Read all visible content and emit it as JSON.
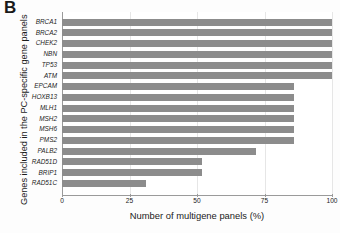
{
  "figure": {
    "panel_letter": "B",
    "background_color": "#ffffff",
    "bar_color": "#8c8c8c",
    "grid_color": "#e6e6e6",
    "axis_color": "#9a9a9a"
  },
  "chart_data": {
    "type": "bar",
    "orientation": "horizontal",
    "title": "",
    "xlabel": "Number of multigene  panels (%)",
    "ylabel": "Genes included in the PC-specific gene panels",
    "xlim": [
      0,
      100
    ],
    "xticks": [
      0,
      25,
      50,
      75,
      100
    ],
    "xtick_labels": [
      "0",
      "25",
      "50",
      "75",
      "100"
    ],
    "grid": true,
    "grid_axis": "x",
    "legend": false,
    "categories": [
      "BRCA1",
      "BRCA2",
      "CHEK2",
      "NBN",
      "TP53",
      "ATM",
      "EPCAM",
      "HOXB13",
      "MLH1",
      "MSH2",
      "MSH6",
      "PMS2",
      "PALB2",
      "RAD51D",
      "BRIP1",
      "RAD51C"
    ],
    "values": [
      100,
      100,
      100,
      100,
      100,
      100,
      86,
      86,
      86,
      86,
      86,
      86,
      72,
      52,
      52,
      31
    ],
    "unit": "%"
  }
}
